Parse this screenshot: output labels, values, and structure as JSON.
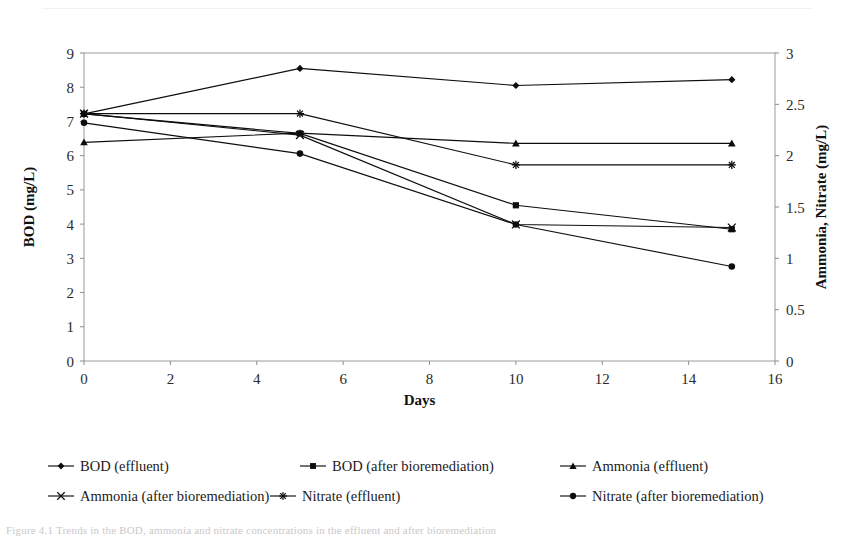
{
  "figure": {
    "caption": "Figure 4.1  Trends in the BOD, ammonia and nitrate concentrations in the effluent and after bioremediation"
  },
  "axes": {
    "x": {
      "label": "Days",
      "ticks": [
        "0",
        "2",
        "4",
        "6",
        "8",
        "10",
        "12",
        "14",
        "16"
      ],
      "min": 0,
      "max": 16
    },
    "y_left": {
      "label": "BOD (mg/L)",
      "ticks": [
        "0",
        "1",
        "2",
        "3",
        "4",
        "5",
        "6",
        "7",
        "8",
        "9"
      ],
      "min": 0,
      "max": 9
    },
    "y_right": {
      "label": "Ammonia, Nitrate (mg/L)",
      "ticks": [
        "0",
        "0.5",
        "1",
        "1.5",
        "2",
        "2.5",
        "3"
      ],
      "min": 0,
      "max": 3
    }
  },
  "legend": {
    "rows": [
      [
        {
          "label": "BOD (effluent)",
          "marker": "diamond-marker"
        },
        {
          "label": "BOD (after bioremediation)",
          "marker": "square-marker"
        },
        {
          "label": "Ammonia (effluent)",
          "marker": "triangle-marker"
        }
      ],
      [
        {
          "label": "Ammonia (after bioremediation)",
          "marker": "cross-marker"
        },
        {
          "label": "Nitrate (effluent)",
          "marker": "asterisk-marker"
        },
        {
          "label": "Nitrate (after bioremediation)",
          "marker": "circle-marker"
        }
      ]
    ]
  },
  "chart_data": {
    "type": "line",
    "title": "",
    "xlabel": "Days",
    "ylabel": "BOD (mg/L)",
    "y2label": "Ammonia, Nitrate (mg/L)",
    "xlim": [
      0,
      16
    ],
    "ylim": [
      0,
      9
    ],
    "y2lim": [
      0,
      3
    ],
    "grid": false,
    "legend_position": "bottom",
    "x": [
      0,
      5,
      10,
      15
    ],
    "series": [
      {
        "name": "BOD (effluent)",
        "axis": "left",
        "marker": "diamond",
        "color": "#0d0d0d",
        "values": [
          7.22,
          8.55,
          8.05,
          8.22
        ]
      },
      {
        "name": "BOD (after bioremediation)",
        "axis": "left",
        "marker": "square",
        "color": "#0d0d0d",
        "values": [
          7.22,
          6.65,
          4.55,
          3.85
        ]
      },
      {
        "name": "Ammonia (effluent)",
        "axis": "right",
        "marker": "triangle",
        "color": "#0d0d0d",
        "values": [
          2.13,
          2.22,
          2.12,
          2.12
        ]
      },
      {
        "name": "Ammonia (after bioremediation)",
        "axis": "right",
        "marker": "cross",
        "color": "#0d0d0d",
        "values": [
          2.41,
          2.2,
          1.33,
          1.3
        ]
      },
      {
        "name": "Nitrate (effluent)",
        "axis": "right",
        "marker": "asterisk",
        "color": "#0d0d0d",
        "values": [
          2.41,
          2.41,
          1.91,
          1.91
        ]
      },
      {
        "name": "Nitrate (after bioremediation)",
        "axis": "right",
        "marker": "circle",
        "color": "#0d0d0d",
        "values": [
          2.32,
          2.02,
          1.33,
          0.92
        ]
      }
    ]
  }
}
